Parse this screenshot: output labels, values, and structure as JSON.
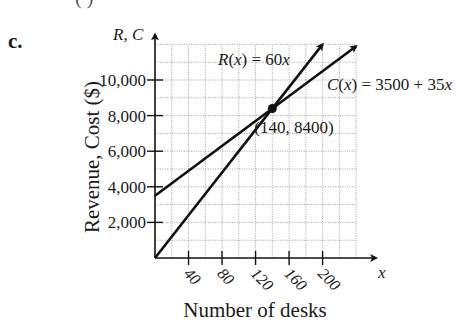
{
  "part_label": "c.",
  "top_fragment": "( )",
  "chart_data": {
    "type": "line",
    "title": "",
    "xlabel": "Number of desks",
    "ylabel": "Revenue, Cost ($)",
    "x_axis_var": "x",
    "y_axis_var": "R, C",
    "xlim": [
      0,
      240
    ],
    "ylim": [
      0,
      12000
    ],
    "x_ticks": [
      40,
      80,
      120,
      160,
      200
    ],
    "y_ticks": [
      2000,
      4000,
      6000,
      8000,
      10000
    ],
    "y_tick_labels": [
      "2,000",
      "4,000",
      "6,000",
      "8,000",
      "10,000"
    ],
    "grid": true,
    "grid_x_step": 20,
    "grid_y_step": 1000,
    "series": [
      {
        "name": "R(x) = 60x",
        "label_var": "R(x)",
        "label_expr": "= 60x",
        "x": [
          0,
          140,
          200
        ],
        "values": [
          0,
          8400,
          12000
        ]
      },
      {
        "name": "C(x) = 3500 + 35x",
        "label_var": "C(x)",
        "label_expr": "= 3500 + 35x",
        "x": [
          0,
          140,
          240
        ],
        "values": [
          3500,
          8400,
          11900
        ]
      }
    ],
    "annotations": [
      {
        "text": "(140, 8400)",
        "x": 140,
        "y": 8400,
        "type": "intersection-point"
      }
    ]
  }
}
